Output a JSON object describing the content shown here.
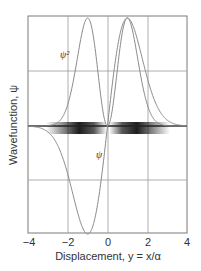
{
  "chart_data": {
    "type": "line",
    "title": "",
    "xlabel": "Displacement, y = x/α",
    "ylabel": "Wavefunction, ψ",
    "xlim": [
      -4,
      4
    ],
    "ylim": [
      -1,
      1
    ],
    "grid": true,
    "xticks": [
      "-4",
      "-2",
      "0",
      "2",
      "4"
    ],
    "series": [
      {
        "name": "ψ",
        "label": "ψ",
        "description": "First excited harmonic oscillator wavefunction, antisymmetric, minimum near y=-1, maximum near y=+1",
        "x": [
          -4,
          -3,
          -2,
          -1.5,
          -1,
          -0.5,
          0,
          0.5,
          1,
          1.5,
          2,
          3,
          4
        ],
        "values": [
          -0.0,
          -0.04,
          -0.32,
          -0.72,
          -1.0,
          -0.72,
          0.0,
          0.72,
          1.0,
          0.72,
          0.32,
          0.04,
          0.0
        ]
      },
      {
        "name": "ψ²",
        "label": "ψ²",
        "description": "Probability density, two peaks near y=±1, zero at y=0",
        "x": [
          -4,
          -3,
          -2,
          -1.5,
          -1,
          -0.5,
          0,
          0.5,
          1,
          1.5,
          2,
          3,
          4
        ],
        "values": [
          0.0,
          0.0,
          0.1,
          0.52,
          1.0,
          0.52,
          0.0,
          0.52,
          1.0,
          0.52,
          0.1,
          0.0,
          0.0
        ]
      }
    ],
    "annotations": [
      {
        "text": "ψ²",
        "near": "left upper curve"
      },
      {
        "text": "ψ",
        "near": "center below axis"
      },
      {
        "text": "shaded probability band",
        "near": "along y=0 axis, dark at y=±1"
      }
    ]
  },
  "labels": {
    "xlabel": "Displacement, y = x/α",
    "ylabel": "Wavefunction, ψ",
    "psi_sq": "ψ²",
    "psi": "ψ",
    "ticks": [
      "−4",
      "−2",
      "0",
      "2",
      "4"
    ]
  },
  "colors": {
    "curve": "#8a8a8a",
    "grid": "#9a9a9a",
    "frame": "#7a7a7a",
    "band": "#111111"
  }
}
